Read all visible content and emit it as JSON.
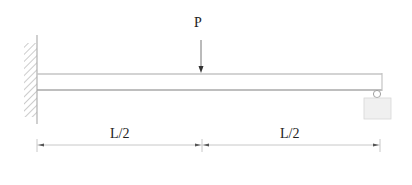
{
  "diagram": {
    "type": "beam",
    "load": {
      "label": "P",
      "position": "midspan"
    },
    "supports": {
      "left": "fixed-wall",
      "right": "roller"
    },
    "dimensions": [
      {
        "label": "L/2",
        "segment": "left"
      },
      {
        "label": "L/2",
        "segment": "right"
      }
    ],
    "colors": {
      "line": "#b8b8b8",
      "hatch": "#9a9a9a",
      "arrow": "#333333",
      "text": "#222222",
      "support_fill": "#f0f0f0"
    }
  }
}
